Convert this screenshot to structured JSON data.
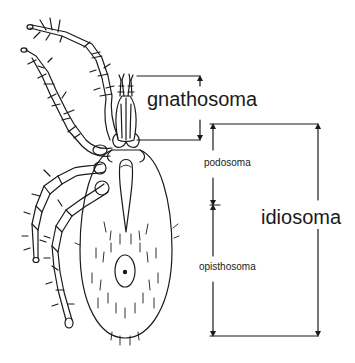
{
  "figure": {
    "colors": {
      "line": "#1a1a1a",
      "background": "#ffffff"
    }
  },
  "labels": {
    "gnathosoma": "gnathosoma",
    "idiosoma": "idiosoma",
    "podosoma": "podosoma",
    "opisthosoma": "opisthosoma"
  },
  "brackets": [
    {
      "name": "gnathosoma",
      "top_y": 76,
      "bottom_y": 140
    },
    {
      "name": "podosoma",
      "top_y": 124,
      "bottom_y": 205
    },
    {
      "name": "opisthosoma",
      "top_y": 205,
      "bottom_y": 336
    },
    {
      "name": "idiosoma",
      "top_y": 124,
      "bottom_y": 336
    }
  ]
}
